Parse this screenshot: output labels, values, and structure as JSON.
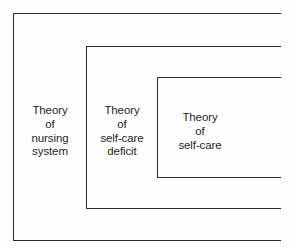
{
  "figure": {
    "background_color": "#fefefe",
    "line_color": "#2b2b2b",
    "text_color": "#262626"
  },
  "boxes": [
    {
      "id": "outer",
      "name": "theory-of-nursing-system-box",
      "level": 1,
      "label": "Theory\nof\nnursing\nsystem",
      "lines": [
        "Theory",
        "of",
        "nursing",
        "system"
      ]
    },
    {
      "id": "middle",
      "name": "theory-of-self-care-deficit-box",
      "level": 2,
      "label": "Theory\nof\nself-care\ndeficit",
      "lines": [
        "Theory",
        "of",
        "self-care",
        "deficit"
      ]
    },
    {
      "id": "inner",
      "name": "theory-of-self-care-box",
      "level": 3,
      "label": "Theory\nof\nself-care",
      "lines": [
        "Theory",
        "of",
        "self-care"
      ]
    }
  ]
}
